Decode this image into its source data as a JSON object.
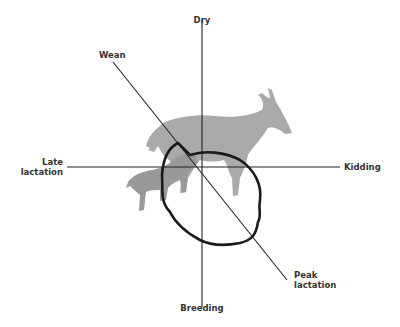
{
  "diagram": {
    "type": "cycle-quadrant",
    "axes": {
      "top": "Dry",
      "bottom": "Breeding",
      "left": "Late lactation",
      "right": "Kidding"
    },
    "diagonal": {
      "start": "Wean",
      "end": "Peak lactation"
    },
    "labels": {
      "dry": "Dry",
      "breeding": "Breeding",
      "late_line1": "Late",
      "late_line2": "lactation",
      "kidding": "Kidding",
      "wean": "Wean",
      "peak_line1": "Peak",
      "peak_line2": "lactation"
    },
    "illustration": [
      "adult-goat-silhouette",
      "kid-goat-silhouette"
    ],
    "colors": {
      "lines": "#222222",
      "loop": "#1a1a1a",
      "goat": "#aaaaaa",
      "kid": "#999999",
      "text": "#333333"
    }
  }
}
